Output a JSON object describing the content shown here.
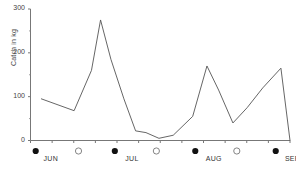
{
  "chart_data": {
    "type": "line",
    "title": "",
    "xlabel": "",
    "ylabel": "Catch in kg",
    "ylim": [
      0,
      300
    ],
    "yticks": [
      0,
      100,
      200,
      300
    ],
    "ytick_labels": [
      "0",
      "100",
      "200",
      "300"
    ],
    "minor_yticks": [
      50,
      150,
      250
    ],
    "grid": false,
    "legend": "none",
    "xlim": [
      0,
      100
    ],
    "series": [
      {
        "name": "Catch",
        "color": "#555555",
        "x": [
          4.2,
          16.8,
          23.5,
          27.0,
          31.0,
          36.0,
          40.5,
          44.5,
          49.5,
          55.0,
          62.5,
          68.0,
          72.5,
          78.0,
          83.5,
          89.5,
          96.5,
          100.0
        ],
        "values": [
          95,
          68,
          160,
          275,
          185,
          95,
          22,
          18,
          5,
          12,
          55,
          170,
          115,
          40,
          75,
          120,
          165,
          0
        ]
      }
    ],
    "x_axis_months": [
      {
        "label": "JUN",
        "x": 8.5
      },
      {
        "label": "JUL",
        "x": 40.0
      },
      {
        "label": "AUG",
        "x": 71.0
      },
      {
        "label": "SEP",
        "x": 101.5
      }
    ],
    "moon_markers": [
      {
        "phase": "new",
        "x": 2.0
      },
      {
        "phase": "full",
        "x": 18.5
      },
      {
        "phase": "new",
        "x": 32.5
      },
      {
        "phase": "full",
        "x": 48.5
      },
      {
        "phase": "new",
        "x": 63.5
      },
      {
        "phase": "full",
        "x": 79.5
      },
      {
        "phase": "new",
        "x": 94.5
      }
    ],
    "xtick_count": 13
  },
  "axes": {
    "y_title": "Catch in kg"
  }
}
